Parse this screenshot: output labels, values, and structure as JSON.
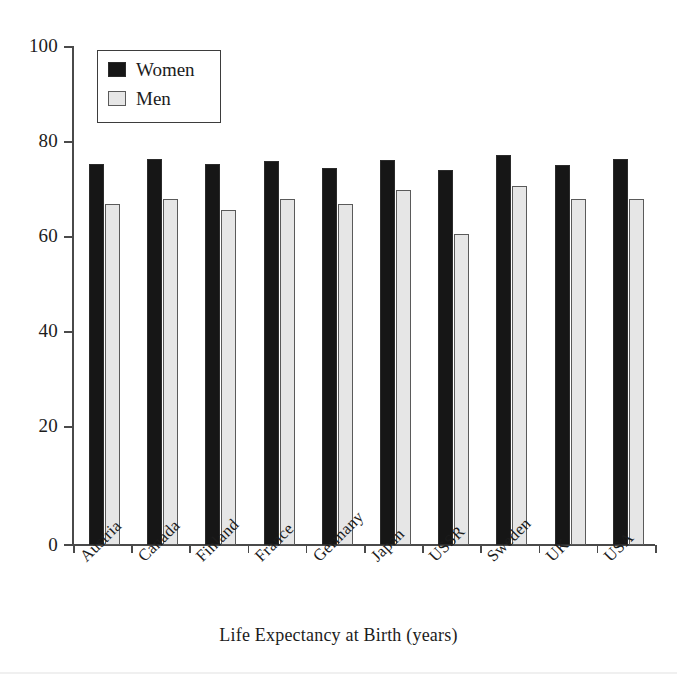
{
  "chart_data": {
    "type": "bar",
    "title": "",
    "xlabel": "Life Expectancy at Birth (years)",
    "ylabel": "",
    "categories": [
      "Austria",
      "Canada",
      "Finland",
      "France",
      "Germany",
      "Japan",
      "USSR",
      "Sweden",
      "UK",
      "USA"
    ],
    "series": [
      {
        "name": "Women",
        "color": "#161616",
        "values": [
          76.3,
          77.3,
          76.3,
          77.0,
          75.5,
          77.2,
          75.2,
          78.1,
          76.2,
          77.3
        ]
      },
      {
        "name": "Men",
        "color": "#e6e6e6",
        "values": [
          68.4,
          69.3,
          67.2,
          69.3,
          68.3,
          71.1,
          62.3,
          72.0,
          69.3,
          69.3
        ]
      }
    ],
    "ylim": [
      0,
      100
    ],
    "yticks": [
      0,
      20,
      40,
      60,
      80,
      100
    ],
    "ytick_labels": [
      "0",
      "20",
      "40",
      "60",
      "80",
      "100"
    ],
    "grid": false,
    "legend_position": "upper-left",
    "xtick_rotation": 45
  },
  "legend": {
    "entries": [
      {
        "label": "Women",
        "swatch": "women"
      },
      {
        "label": "Men",
        "swatch": "men"
      }
    ]
  },
  "axis": {
    "x_title": "Life Expectancy at Birth (years)"
  }
}
